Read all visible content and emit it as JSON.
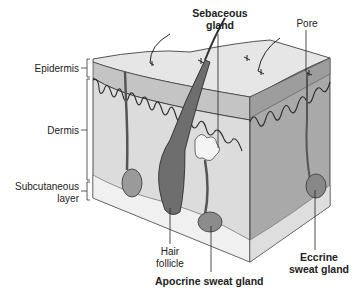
{
  "figure": {
    "type": "anatomical cross-section",
    "palette": {
      "surface": "#e6e6e6",
      "epidermis_front": "#bdbdbd",
      "dermis_front": "#dadada",
      "right_face": "#a8a8a8",
      "subcutaneous": "#efefef",
      "hair_follicle": "#6e6e6e",
      "outline": "#2a2a2a"
    }
  },
  "labels": {
    "left": {
      "epidermis": "Epidermis",
      "dermis": "Dermis",
      "subcutaneous_line1": "Subcutaneous",
      "subcutaneous_line2": "layer"
    },
    "top": {
      "sebaceous_line1": "Sebaceous",
      "sebaceous_line2": "gland",
      "pore": "Pore"
    },
    "bottom": {
      "hair_line1": "Hair",
      "hair_line2": "follicle",
      "apocrine": "Apocrine sweat gland",
      "eccrine_line1": "Eccrine",
      "eccrine_line2": "sweat gland"
    }
  }
}
